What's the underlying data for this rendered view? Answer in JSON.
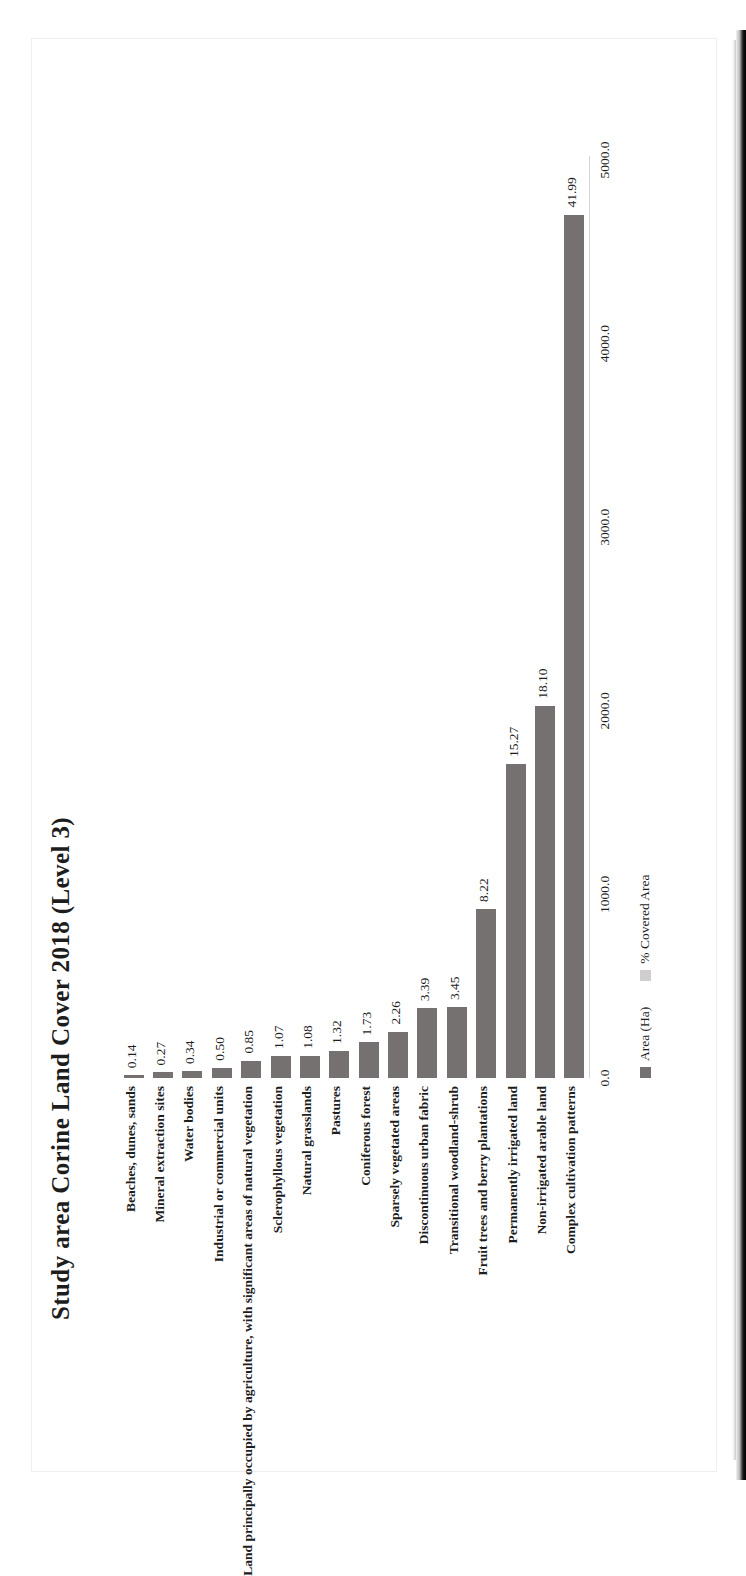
{
  "document": {
    "kind": "scanned-figure-page",
    "orientation": "rotated-90-ccw"
  },
  "chart_data": {
    "type": "bar",
    "orientation": "vertical-bars-on-rotated-page",
    "title": "Study area Corine Land Cover 2018 (Level 3)",
    "xlabel": "",
    "ylabel": "",
    "categories": [
      "Beaches, dunes, sands",
      "Mineral extraction sites",
      "Water bodies",
      "Industrial or commercial units",
      "Land principally occupied by agriculture, with significant areas of natural vegetation",
      "Sclerophyllous vegetation",
      "Natural grasslands",
      "Pastures",
      "Coniferous forest",
      "Sparsely vegetated areas",
      "Discontinuous urban fabric",
      "Transitional woodland-shrub",
      "Fruit trees and berry plantations",
      "Permanently irrigated land",
      "Non-irrigated arable land",
      "Complex cultivation patterns"
    ],
    "data_labels": [
      "0.14",
      "0.27",
      "0.34",
      "0.50",
      "0.85",
      "1.07",
      "1.08",
      "1.32",
      "1.73",
      "2.26",
      "3.39",
      "3.45",
      "8.22",
      "15.27",
      "18.10",
      "41.99"
    ],
    "series": [
      {
        "name": "Area (Ha)",
        "color": "#767171",
        "values": [
          15.7,
          30.2,
          38.1,
          56.0,
          95.2,
          119.8,
          120.9,
          147.8,
          193.8,
          253.1,
          379.7,
          386.4,
          920.6,
          1710.2,
          2027.2,
          4702.9
        ]
      },
      {
        "name": "% Covered Area",
        "color": "#d0cece",
        "values": [
          0.14,
          0.27,
          0.34,
          0.5,
          0.85,
          1.07,
          1.08,
          1.32,
          1.73,
          2.26,
          3.39,
          3.45,
          8.22,
          15.27,
          18.1,
          41.99
        ]
      }
    ],
    "axis": {
      "ticks": [
        "0.0",
        "1000.0",
        "2000.0",
        "3000.0",
        "4000.0",
        "5000.0"
      ],
      "tick_values": [
        0,
        1000,
        2000,
        3000,
        4000,
        5000
      ],
      "range": [
        0,
        5000
      ],
      "grid": false
    },
    "legend": {
      "position": "bottom",
      "entries": [
        {
          "label": "Area (Ha)",
          "color": "#767171"
        },
        {
          "label": "% Covered Area",
          "color": "#d0cece"
        }
      ]
    }
  },
  "colors": {
    "bar": "#767171",
    "legend_secondary": "#d0cece",
    "text": "#1d1d1d",
    "axis_line": "#d4d4d4",
    "page": "#ffffff"
  }
}
